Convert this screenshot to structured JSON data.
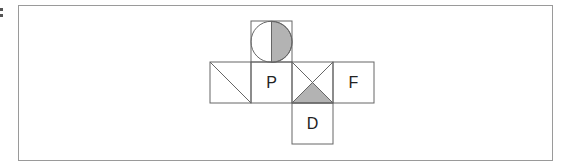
{
  "diagram": {
    "type": "cube-net",
    "stroke_color": "#666666",
    "shade_color": "#b3b3b3",
    "faces": [
      {
        "id": "top",
        "label": "",
        "pattern": "circle-right-half-shaded"
      },
      {
        "id": "left",
        "label": "",
        "pattern": "diagonal-top-left-to-bottom-right"
      },
      {
        "id": "center",
        "label": "P",
        "pattern": "none"
      },
      {
        "id": "cross",
        "label": "",
        "pattern": "x-cross-bottom-triangle-shaded"
      },
      {
        "id": "right",
        "label": "F",
        "pattern": "none"
      },
      {
        "id": "bottom",
        "label": "D",
        "pattern": "none"
      }
    ]
  }
}
